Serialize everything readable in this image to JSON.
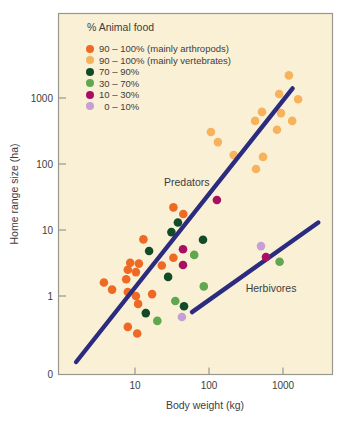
{
  "chart_data": {
    "type": "scatter",
    "title": "",
    "xlabel": "Body weight (kg)",
    "ylabel": "Home range size (ha)",
    "x_scale": "log",
    "y_scale": "log",
    "x_ticks": [
      "10",
      "100",
      "1000"
    ],
    "y_ticks": [
      "1",
      "10",
      "100",
      "1000"
    ],
    "origin_tick": "0",
    "x_range_kg": [
      1,
      4700
    ],
    "y_range_ha": [
      0.06,
      20000
    ],
    "grid": false,
    "legend_title": "% Animal food",
    "legend_position": "top-left-inside",
    "colors": {
      "plot_bg": "#FAF0D6",
      "border": "#98988E",
      "text": "#3D3D3D",
      "trend_line": "#2B2B7F"
    },
    "series": [
      {
        "id": "arthropods-90-100",
        "label": "90 – 100% (mainly arthropods)",
        "color": "#EE6A24",
        "points_kg_ha": [
          [
            33,
            22
          ],
          [
            45,
            17.5
          ],
          [
            13,
            7.2
          ],
          [
            33,
            3.8
          ],
          [
            23,
            2.9
          ],
          [
            8.6,
            3.2
          ],
          [
            11.3,
            3.1
          ],
          [
            8.0,
            2.5
          ],
          [
            10.3,
            2.3
          ],
          [
            7.6,
            1.8
          ],
          [
            3.8,
            1.6
          ],
          [
            4.9,
            1.25
          ],
          [
            8.0,
            1.15
          ],
          [
            10.3,
            1.0
          ],
          [
            11,
            0.76
          ],
          [
            17,
            1.07
          ],
          [
            8.0,
            0.34
          ],
          [
            10.7,
            0.27
          ]
        ]
      },
      {
        "id": "vertebrates-90-100",
        "label": "90 – 100% (mainly vertebrates)",
        "color": "#F7B35C",
        "points_kg_ha": [
          [
            1200,
            2200
          ],
          [
            885,
            1150
          ],
          [
            1600,
            960
          ],
          [
            520,
            615
          ],
          [
            940,
            590
          ],
          [
            420,
            450
          ],
          [
            1330,
            450
          ],
          [
            830,
            330
          ],
          [
            106,
            305
          ],
          [
            132,
            215
          ],
          [
            216,
            137
          ],
          [
            537,
            128
          ],
          [
            432,
            84
          ]
        ]
      },
      {
        "id": "animal-food-70-90",
        "label": "70 – 90%",
        "color": "#124C26",
        "points_kg_ha": [
          [
            38,
            13
          ],
          [
            31,
            9.3
          ],
          [
            15.5,
            4.8
          ],
          [
            83,
            7.1
          ],
          [
            28,
            1.95
          ],
          [
            46,
            0.7
          ],
          [
            14,
            0.55
          ]
        ]
      },
      {
        "id": "animal-food-30-70",
        "label": "30 – 70%",
        "color": "#61A74F",
        "points_kg_ha": [
          [
            63,
            4.2
          ],
          [
            85,
            1.4
          ],
          [
            900,
            3.3
          ],
          [
            35,
            0.84
          ],
          [
            20,
            0.42
          ]
        ]
      },
      {
        "id": "animal-food-10-30",
        "label": "10 – 30%",
        "color": "#A80F62",
        "points_kg_ha": [
          [
            128,
            28.5
          ],
          [
            44.5,
            5.1
          ],
          [
            44.5,
            2.95
          ],
          [
            590,
            3.9
          ]
        ]
      },
      {
        "id": "animal-food-0-10",
        "label": " 0 – 10%",
        "color": "#C6A0D4",
        "points_kg_ha": [
          [
            505,
            5.7
          ],
          [
            43,
            0.48
          ]
        ]
      }
    ],
    "trend_lines": [
      {
        "label": "Predators",
        "points_kg_ha": [
          [
            1.6,
            0.1
          ],
          [
            1350,
            1400
          ]
        ],
        "label_at_kg_ha": [
          50,
          54
        ]
      },
      {
        "label": "Herbivores",
        "points_kg_ha": [
          [
            59,
            0.57
          ],
          [
            3000,
            13
          ]
        ],
        "label_at_kg_ha": [
          690,
          1.3
        ]
      }
    ]
  }
}
